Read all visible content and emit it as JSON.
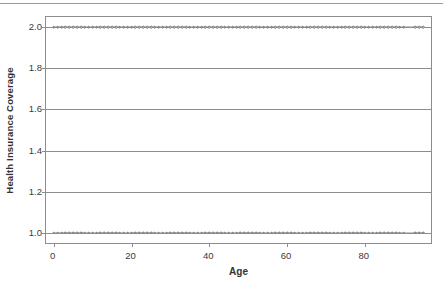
{
  "figure": {
    "background_color": "#ffffff",
    "axis_color": "#8d8d8d",
    "text_color": "#3a3a3a",
    "marker_color": "#6f6f6f",
    "top_rule": "horizontal-rule"
  },
  "chart_data": {
    "type": "scatter",
    "title": "",
    "xlabel": "Age",
    "ylabel": "Health Insurance Coverage",
    "xlim": [
      -2,
      97
    ],
    "ylim": [
      0.95,
      2.05
    ],
    "xticks": [
      0,
      20,
      40,
      60,
      80
    ],
    "xtick_labels": [
      "0",
      "20",
      "40",
      "60",
      "80"
    ],
    "yticks": [
      1.0,
      1.2,
      1.4,
      1.6,
      1.8,
      2.0
    ],
    "ytick_labels": [
      "1.0",
      "1.2",
      "1.4",
      "1.6",
      "1.8",
      "2.0"
    ],
    "grid": "horizontal",
    "legend": "none",
    "series": [
      {
        "name": "Coverage = 2.0",
        "y": 2.0,
        "marker": "open-circle",
        "x": [
          0,
          1,
          2,
          3,
          4,
          5,
          6,
          7,
          8,
          9,
          10,
          11,
          12,
          13,
          14,
          15,
          16,
          17,
          18,
          19,
          20,
          21,
          22,
          23,
          24,
          25,
          26,
          27,
          28,
          29,
          30,
          31,
          32,
          33,
          34,
          35,
          36,
          37,
          38,
          39,
          40,
          41,
          42,
          43,
          44,
          45,
          46,
          47,
          48,
          49,
          50,
          51,
          52,
          53,
          54,
          55,
          56,
          57,
          58,
          59,
          60,
          61,
          62,
          63,
          64,
          65,
          66,
          67,
          68,
          69,
          70,
          71,
          72,
          73,
          74,
          75,
          76,
          77,
          78,
          79,
          80,
          81,
          82,
          83,
          84,
          85,
          86,
          87,
          88,
          89,
          90,
          93,
          94,
          95
        ]
      },
      {
        "name": "Coverage = 1.0",
        "y": 1.0,
        "marker": "open-circle",
        "x": [
          0,
          1,
          2,
          3,
          4,
          5,
          6,
          7,
          8,
          9,
          10,
          11,
          12,
          13,
          14,
          15,
          16,
          17,
          18,
          19,
          20,
          21,
          22,
          23,
          24,
          25,
          26,
          27,
          28,
          29,
          30,
          31,
          32,
          33,
          34,
          35,
          36,
          37,
          38,
          39,
          40,
          41,
          42,
          43,
          44,
          45,
          46,
          47,
          48,
          49,
          50,
          51,
          52,
          53,
          54,
          55,
          56,
          57,
          58,
          59,
          60,
          61,
          62,
          63,
          64,
          65,
          66,
          67,
          68,
          69,
          70,
          71,
          72,
          73,
          74,
          75,
          76,
          77,
          78,
          79,
          80,
          81,
          82,
          83,
          84,
          85,
          86,
          87,
          88,
          89,
          90,
          93,
          94,
          95
        ]
      }
    ]
  }
}
